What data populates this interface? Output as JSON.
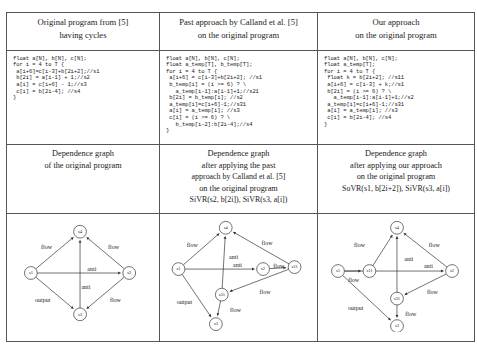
{
  "figure": {
    "columns": [
      {
        "id": "original",
        "header": [
          "Original program from [5]",
          "having cycles"
        ],
        "code": [
          "float a[N], b[N], c[N];",
          "for i = 4 to T {",
          " a[i+6]=c[i-3]+b[2i+2];//s1",
          " b[2i] = a[i-1] + 1;//s2",
          " a[i] = c[i+6] - 1;//s3",
          " c[i] = b[2i-4]; //s4",
          "}"
        ],
        "caption": [
          "Dependence graph",
          "of the original program"
        ]
      },
      {
        "id": "calland",
        "header": [
          "Past approach by Calland et al. [5]",
          "on the original program"
        ],
        "code": [
          "float a[N], b[N], c[N];",
          "float a_temp[T], b_temp[T];",
          "for i = 4 to T {",
          " a[i+6] = c[i-3]+b[2i+2]; //s1",
          " b_temp[i] = (i >= 6) ? \\",
          "   a_temp[i-1]:a[i-1]+1;//s21",
          " b[2i] = b_temp[i]; //s2",
          " a_temp[i]=c[i+6]-1;//s31",
          " a[i] = a_temp[i]; //s3",
          " c[i] = (i >= 6) ? \\",
          "   b_temp[i-2]:b[2i-4];//s4",
          "}"
        ],
        "caption": [
          "Dependence graph",
          "after applying the past",
          "approach by Calland et al. [5]",
          "on the original program",
          "SiVR(s2, b[2i]), SiVR(s3, a[i])"
        ]
      },
      {
        "id": "ours",
        "header": [
          "Our approach",
          "on the original program"
        ],
        "code": [
          "float a[N], b[N], c[N];",
          "float a_temp[T];",
          "for i = 4 to T {",
          " float k = b[2i+2]; //s11",
          " a[i+6] = c[i-3] + k;//s1",
          " b[2i] = (i >= 6) ? \\",
          "   a_temp[i-1]:a[i-1]+1;//s2",
          " a_temp[i]=c[i+6]-1;//s31",
          " a[i] = a_temp[i]; //s3",
          " c[i] = b[2i-4]; //s4",
          "}"
        ],
        "caption": [
          "Dependence graph",
          "after applying our approach",
          "on the original program",
          "SoVR(s1, b[2i+2]), SiVR(s3, a[i])"
        ]
      }
    ],
    "graphs": [
      {
        "id": "graph-original",
        "nodes": [
          {
            "id": "s4",
            "label": "s4",
            "x": 72,
            "y": 18
          },
          {
            "id": "s1",
            "label": "s1",
            "x": 22,
            "y": 60
          },
          {
            "id": "s2",
            "label": "s2",
            "x": 122,
            "y": 60
          },
          {
            "id": "s3",
            "label": "s3",
            "x": 72,
            "y": 102
          }
        ],
        "edges": [
          {
            "from": "s1",
            "to": "s4",
            "label": "flow",
            "lx": 38,
            "ly": 34
          },
          {
            "from": "s2",
            "to": "s4",
            "label": "flow",
            "lx": 106,
            "ly": 34
          },
          {
            "from": "s3",
            "to": "s4",
            "label": "anti",
            "lx": 84,
            "ly": 57
          },
          {
            "from": "s1",
            "to": "s2",
            "label": "anti",
            "lx": 78,
            "ly": 75
          },
          {
            "from": "s1",
            "to": "s3",
            "label": "output",
            "lx": 34,
            "ly": 88
          },
          {
            "from": "s2",
            "to": "s3",
            "label": "flow",
            "lx": 108,
            "ly": 88
          }
        ]
      },
      {
        "id": "graph-calland",
        "nodes": [
          {
            "id": "s4",
            "label": "s4",
            "x": 62,
            "y": 14
          },
          {
            "id": "s1",
            "label": "s1",
            "x": 14,
            "y": 56
          },
          {
            "id": "s2",
            "label": "s2",
            "x": 100,
            "y": 56
          },
          {
            "id": "s21",
            "label": "s21",
            "x": 132,
            "y": 54
          },
          {
            "id": "s31",
            "label": "s31",
            "x": 58,
            "y": 82
          },
          {
            "id": "s3",
            "label": "s3",
            "x": 52,
            "y": 112
          }
        ],
        "edges": [
          {
            "from": "s1",
            "to": "s4",
            "label": "flow",
            "lx": 28,
            "ly": 32
          },
          {
            "from": "s21",
            "to": "s4",
            "label": "flow",
            "lx": 104,
            "ly": 30
          },
          {
            "from": "s31",
            "to": "s4",
            "label": "anti",
            "lx": 70,
            "ly": 44
          },
          {
            "from": "s1",
            "to": "s2",
            "label": "anti",
            "lx": 74,
            "ly": 52
          },
          {
            "from": "s2",
            "to": "s21",
            "label": "flow",
            "lx": 116,
            "ly": 54
          },
          {
            "from": "s21",
            "to": "s31",
            "label": "flow",
            "lx": 102,
            "ly": 80
          },
          {
            "from": "s1",
            "to": "s3",
            "label": "output",
            "lx": 20,
            "ly": 90
          },
          {
            "from": "s31",
            "to": "s3",
            "label": "flow",
            "lx": 72,
            "ly": 98
          }
        ]
      },
      {
        "id": "graph-ours",
        "nodes": [
          {
            "id": "s4",
            "label": "s4",
            "x": 76,
            "y": 14
          },
          {
            "id": "s1",
            "label": "s1",
            "x": 16,
            "y": 58
          },
          {
            "id": "s11",
            "label": "s11",
            "x": 48,
            "y": 58
          },
          {
            "id": "s2",
            "label": "s2",
            "x": 132,
            "y": 58
          },
          {
            "id": "s31",
            "label": "s31",
            "x": 76,
            "y": 86
          },
          {
            "id": "s3",
            "label": "s3",
            "x": 76,
            "y": 114
          }
        ],
        "edges": [
          {
            "from": "s11",
            "to": "s4",
            "label": "flow",
            "lx": 38,
            "ly": 32
          },
          {
            "from": "s2",
            "to": "s4",
            "label": "flow",
            "lx": 114,
            "ly": 32
          },
          {
            "from": "s31",
            "to": "s4",
            "label": "anti",
            "lx": 88,
            "ly": 46
          },
          {
            "from": "s1",
            "to": "s2",
            "label": "anti",
            "lx": 108,
            "ly": 54
          },
          {
            "from": "s1",
            "to": "s11",
            "label": "flow",
            "lx": 32,
            "ly": 68
          },
          {
            "from": "s2",
            "to": "s31",
            "label": "flow",
            "lx": 112,
            "ly": 80
          },
          {
            "from": "s1",
            "to": "s3",
            "label": "output",
            "lx": 34,
            "ly": 96
          },
          {
            "from": "s31",
            "to": "s3",
            "label": "flow",
            "lx": 90,
            "ly": 102
          }
        ]
      }
    ]
  }
}
